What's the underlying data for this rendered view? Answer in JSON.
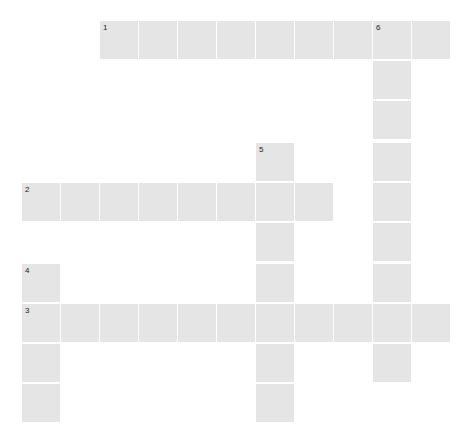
{
  "puzzle": {
    "cell_color": "#e5e5e5",
    "number_color": "#222222",
    "grid": {
      "col_x": [
        22,
        61,
        100,
        139,
        178,
        217,
        256,
        295,
        334,
        373,
        412
      ],
      "row_y": [
        21,
        61,
        101,
        143,
        183,
        223,
        264,
        304,
        344,
        384
      ],
      "cell_size": 38
    },
    "entries": [
      {
        "number": "1",
        "direction": "across",
        "row": 0,
        "col": 2,
        "length": 9,
        "value": ""
      },
      {
        "number": "2",
        "direction": "across",
        "row": 4,
        "col": 0,
        "length": 8,
        "value": ""
      },
      {
        "number": "3",
        "direction": "across",
        "row": 7,
        "col": 0,
        "length": 11,
        "value": ""
      },
      {
        "number": "4",
        "direction": "down",
        "row": 6,
        "col": 0,
        "length": 4,
        "value": ""
      },
      {
        "number": "5",
        "direction": "down",
        "row": 3,
        "col": 6,
        "length": 7,
        "value": ""
      },
      {
        "number": "6",
        "direction": "down",
        "row": 0,
        "col": 9,
        "length": 9,
        "value": ""
      }
    ]
  }
}
